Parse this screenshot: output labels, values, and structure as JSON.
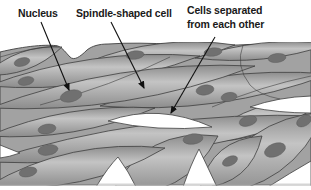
{
  "diagram": {
    "labels": {
      "nucleus": "Nucleus",
      "spindle": "Spindle-shaped cell",
      "separated_line1": "Cells separated",
      "separated_line2": "from each other"
    },
    "colors": {
      "background": "#ffffff",
      "cell_base": "#a2a2a2",
      "cell_highlight": "#c4c4c4",
      "cell_shadow": "#8c8c8c",
      "cell_outline": "#3f3f3f",
      "nucleus_fill": "#707070",
      "text": "#1a1a1a"
    },
    "nuclei": [
      {
        "x": 22,
        "y": 62,
        "rx": 8,
        "ry": 4.2,
        "rot": -14
      },
      {
        "x": 135,
        "y": 55,
        "rx": 9,
        "ry": 4.2,
        "rot": -7
      },
      {
        "x": 213,
        "y": 52,
        "rx": 9,
        "ry": 4.2,
        "rot": -7
      },
      {
        "x": 277,
        "y": 58,
        "rx": 9,
        "ry": 4.5,
        "rot": -7
      },
      {
        "x": 26,
        "y": 81,
        "rx": 8,
        "ry": 4.2,
        "rot": -12
      },
      {
        "x": 71,
        "y": 96,
        "rx": 11,
        "ry": 5.8,
        "rot": -14
      },
      {
        "x": 205,
        "y": 90,
        "rx": 9,
        "ry": 5,
        "rot": -9
      },
      {
        "x": 229,
        "y": 97,
        "rx": 8,
        "ry": 4.5,
        "rot": -9
      },
      {
        "x": 47,
        "y": 129,
        "rx": 9,
        "ry": 4.8,
        "rot": -10
      },
      {
        "x": 48,
        "y": 150,
        "rx": 10,
        "ry": 5.2,
        "rot": -10
      },
      {
        "x": 28,
        "y": 172,
        "rx": 9,
        "ry": 4.8,
        "rot": -12
      },
      {
        "x": 248,
        "y": 121,
        "rx": 9,
        "ry": 5,
        "rot": -16
      },
      {
        "x": 193,
        "y": 139,
        "rx": 10,
        "ry": 5.2,
        "rot": -8
      },
      {
        "x": 275,
        "y": 150,
        "rx": 11,
        "ry": 6.5,
        "rot": -22
      },
      {
        "x": 230,
        "y": 161,
        "rx": 8,
        "ry": 4.5,
        "rot": -25
      },
      {
        "x": 304,
        "y": 121,
        "rx": 8,
        "ry": 5,
        "rot": -30
      }
    ]
  }
}
